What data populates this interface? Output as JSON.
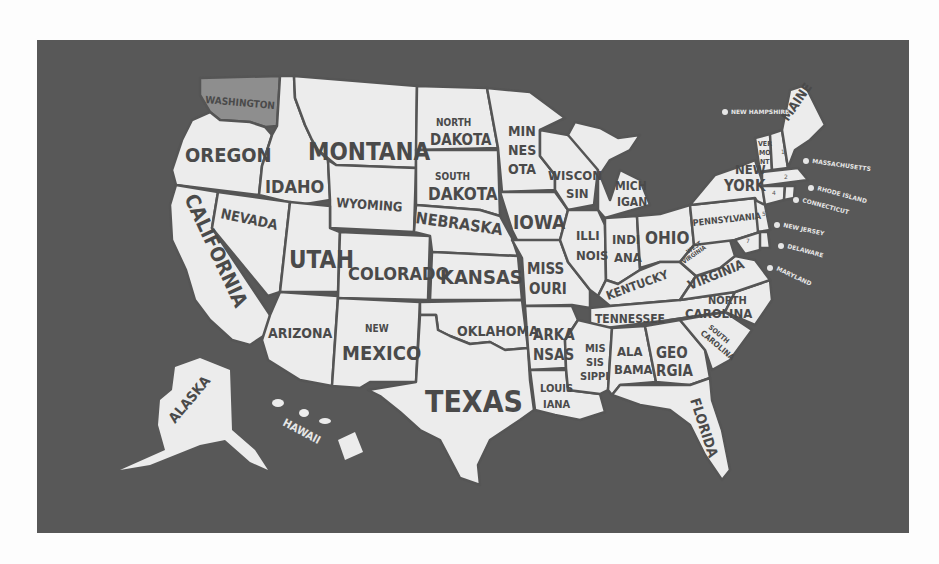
{
  "map": {
    "title": "United States of America",
    "background_color": "#585858",
    "land_color": "#ececec",
    "border_color": "#555555",
    "highlight_color": "#8e8e8e",
    "highlighted_state": "WASHINGTON",
    "states": {
      "washington": "WASHINGTON",
      "oregon": "OREGON",
      "california": "CALIFORNIA",
      "idaho": "IDAHO",
      "nevada": "NEVADA",
      "montana": "MONTANA",
      "wyoming": "WYOMING",
      "utah": "UTAH",
      "arizona": "ARIZONA",
      "colorado": "COLORADO",
      "new_mexico_top": "NEW",
      "new_mexico_bottom": "MEXICO",
      "north_dakota_top": "NORTH",
      "north_dakota_bottom": "DAKOTA",
      "south_dakota_top": "SOUTH",
      "south_dakota_bottom": "DAKOTA",
      "nebraska": "NEBRASKA",
      "kansas": "KANSAS",
      "oklahoma": "OKLAHOMA",
      "texas": "TEXAS",
      "minnesota_1": "MIN",
      "minnesota_2": "NES",
      "minnesota_3": "OTA",
      "iowa": "IOWA",
      "missouri_1": "MISS",
      "missouri_2": "OURI",
      "arkansas_1": "ARKA",
      "arkansas_2": "NSAS",
      "louisiana_1": "LOUIS",
      "louisiana_2": "IANA",
      "wisconsin_1": "WISCON",
      "wisconsin_2": "SIN",
      "illinois_1": "ILLI",
      "illinois_2": "NOIS",
      "michigan_1": "MICH",
      "michigan_2": "IGAN",
      "indiana_1": "INDI",
      "indiana_2": "ANA",
      "ohio": "OHIO",
      "kentucky": "KENTUCKY",
      "tennessee": "TENNESSEE",
      "mississippi_1": "MIS",
      "mississippi_2": "SIS",
      "mississippi_3": "SIPPI",
      "alabama_1": "ALA",
      "alabama_2": "BAMA",
      "georgia_1": "GEO",
      "georgia_2": "RGIA",
      "florida": "FLORIDA",
      "south_carolina_1": "SOUTH",
      "south_carolina_2": "CAROLINA",
      "north_carolina_1": "NORTH",
      "north_carolina_2": "CAROLINA",
      "virginia": "VIRGINIA",
      "west_virginia_1": "WEST",
      "west_virginia_2": "VIRGINIA",
      "pennsylvania": "PENNSYLVANIA",
      "new_york_1": "NEW",
      "new_york_2": "YORK",
      "vermont_1": "VER",
      "vermont_2": "MO",
      "vermont_3": "NT",
      "maine": "MAINE",
      "alaska": "ALASKA",
      "hawaii": "HAWAII"
    },
    "legend": [
      {
        "num": "1",
        "label": "NEW HAMPSHIRE"
      },
      {
        "num": "2",
        "label": "MASSACHUSETTS"
      },
      {
        "num": "3",
        "label": "RHODE ISLAND"
      },
      {
        "num": "4",
        "label": "CONNECTICUT"
      },
      {
        "num": "5",
        "label": "NEW JERSEY"
      },
      {
        "num": "6",
        "label": "DELAWARE"
      },
      {
        "num": "7",
        "label": "MARYLAND"
      }
    ]
  }
}
